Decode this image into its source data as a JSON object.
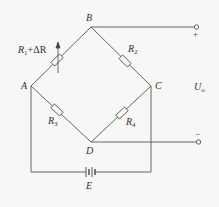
{
  "diagram": {
    "type": "wheatstone-bridge-circuit",
    "nodes": {
      "A": "A",
      "B": "B",
      "C": "C",
      "D": "D"
    },
    "resistors": {
      "r1": {
        "name": "R",
        "sub": "1",
        "suffix": "+ΔR",
        "between": "A-B",
        "variable": true
      },
      "r2": {
        "name": "R",
        "sub": "2",
        "between": "B-C"
      },
      "r3": {
        "name": "R",
        "sub": "3",
        "between": "A-D"
      },
      "r4": {
        "name": "R",
        "sub": "4",
        "between": "C-D"
      }
    },
    "source": {
      "label": "E",
      "between": "A-C (bottom)"
    },
    "output": {
      "label_main": "U",
      "label_sub": "o",
      "plus": "+",
      "minus": "−"
    },
    "colors": {
      "line": "#555555",
      "background": "#f7f7f5",
      "text": "#333333"
    }
  }
}
